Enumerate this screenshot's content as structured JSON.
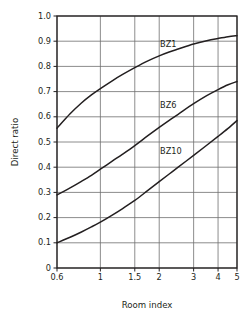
{
  "chart_data": {
    "type": "line",
    "title": "",
    "subtitle": "",
    "xlabel": "Room index",
    "ylabel": "Direct ratio",
    "xticks": [
      0.6,
      1,
      1.5,
      2,
      3,
      4,
      5
    ],
    "xticklabels": [
      "0.6",
      "1",
      "1.5",
      "2",
      "3",
      "4",
      "5"
    ],
    "yticks": [
      0,
      0.1,
      0.2,
      0.3,
      0.4,
      0.5,
      0.6,
      0.7,
      0.8,
      0.9,
      1.0
    ],
    "yticklabels": [
      "0",
      "0.1",
      "0.2",
      "0.3",
      "0.4",
      "0.5",
      "0.6",
      "0.7",
      "0.8",
      "0.9",
      "1.0"
    ],
    "xlim": [
      0.6,
      5
    ],
    "ylim": [
      0,
      1.0
    ],
    "xscale": "log",
    "grid": true,
    "legend_position": "inline-annotations",
    "line_color": "#231f20",
    "grid_color": "#6f6f6f",
    "axis_color": "#231f20",
    "background": "#ffffff",
    "series": [
      {
        "name": "BZ1",
        "label_x": 2.02,
        "label_y": 0.885,
        "x": [
          0.6,
          0.7,
          0.8,
          0.9,
          1.0,
          1.15,
          1.3,
          1.5,
          1.75,
          2.0,
          2.25,
          2.5,
          3.0,
          3.5,
          4.0,
          4.5,
          5.0
        ],
        "values": [
          0.555,
          0.612,
          0.655,
          0.687,
          0.712,
          0.743,
          0.768,
          0.795,
          0.822,
          0.842,
          0.857,
          0.869,
          0.889,
          0.902,
          0.911,
          0.918,
          0.922
        ]
      },
      {
        "name": "BZ6",
        "label_x": 2.02,
        "label_y": 0.645,
        "x": [
          0.6,
          0.7,
          0.8,
          0.9,
          1.0,
          1.15,
          1.3,
          1.5,
          1.75,
          2.0,
          2.25,
          2.5,
          3.0,
          3.5,
          4.0,
          4.5,
          5.0
        ],
        "values": [
          0.29,
          0.318,
          0.344,
          0.368,
          0.392,
          0.424,
          0.452,
          0.486,
          0.525,
          0.558,
          0.586,
          0.61,
          0.652,
          0.684,
          0.708,
          0.727,
          0.74
        ]
      },
      {
        "name": "BZ10",
        "label_x": 2.02,
        "label_y": 0.462,
        "x": [
          0.6,
          0.7,
          0.8,
          0.9,
          1.0,
          1.15,
          1.3,
          1.5,
          1.75,
          2.0,
          2.25,
          2.5,
          3.0,
          3.5,
          4.0,
          4.5,
          5.0
        ],
        "values": [
          0.1,
          0.122,
          0.143,
          0.163,
          0.182,
          0.21,
          0.236,
          0.268,
          0.308,
          0.343,
          0.373,
          0.4,
          0.447,
          0.487,
          0.522,
          0.554,
          0.585
        ]
      }
    ]
  }
}
